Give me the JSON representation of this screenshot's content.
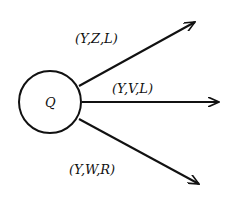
{
  "node": {
    "label": "Q"
  },
  "edges": [
    {
      "label": "(Y,Z,L)",
      "direction": "up-right"
    },
    {
      "label": "(Y,V,L)",
      "direction": "right"
    },
    {
      "label": "(Y,W,R)",
      "direction": "down-right"
    }
  ],
  "colors": {
    "stroke": "#111111",
    "background": "#ffffff"
  }
}
